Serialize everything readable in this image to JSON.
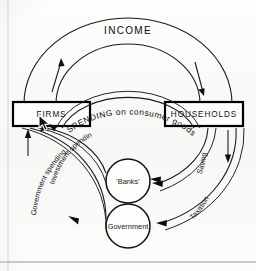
{
  "diagram": {
    "title": "INCOME",
    "type": "circular-flow-of-income",
    "nodes": [
      {
        "id": "firms",
        "label": "FIRMS",
        "shape": "box"
      },
      {
        "id": "households",
        "label": "HOUSEHOLDS",
        "shape": "box"
      },
      {
        "id": "banks",
        "label": "'Banks'",
        "shape": "circle"
      },
      {
        "id": "government",
        "label": "Government",
        "shape": "circle"
      }
    ],
    "flows": [
      {
        "id": "income",
        "label": "INCOME",
        "from": "firms",
        "to": "households",
        "direction": "clockwise"
      },
      {
        "id": "spending",
        "label": "SPENDING on consumer goods",
        "from": "households",
        "to": "firms",
        "direction": "counter-clockwise"
      },
      {
        "id": "saving",
        "label": "Saving",
        "from": "households",
        "to": "banks",
        "direction": "leftward"
      },
      {
        "id": "investment-spending",
        "label": "Investment spending",
        "from": "banks",
        "to": "firms",
        "direction": "leftward-up"
      },
      {
        "id": "taxation",
        "label": "Taxation",
        "from": "households",
        "to": "government",
        "direction": "leftward"
      },
      {
        "id": "government-spending",
        "label": "Government spending",
        "from": "government",
        "to": "firms",
        "direction": "leftward-up"
      }
    ],
    "labels": {
      "income": "INCOME",
      "firms": "FIRMS",
      "households": "HOUSEHOLDS",
      "banks": "'Banks'",
      "government": "Government",
      "spending": "SPENDING on consumer goods",
      "saving": "Saving",
      "investment_spending": "Investment spending",
      "taxation": "Taxation",
      "government_spending": "Government spending"
    },
    "colors": {
      "ink": "#111111",
      "paper": "#fbfbf9",
      "arrow": "#0e0e0e"
    }
  },
  "cursor": {
    "name": "mouse-pointer",
    "x": 38,
    "y": 114
  }
}
